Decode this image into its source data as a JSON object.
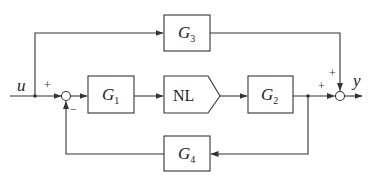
{
  "diagram": {
    "type": "block-diagram",
    "input": {
      "label": "u"
    },
    "output": {
      "label": "y"
    },
    "blocks": [
      {
        "id": "G1",
        "base": "G",
        "sub": "1"
      },
      {
        "id": "NL",
        "label": "NL"
      },
      {
        "id": "G2",
        "base": "G",
        "sub": "2"
      },
      {
        "id": "G3",
        "base": "G",
        "sub": "3"
      },
      {
        "id": "G4",
        "base": "G",
        "sub": "4"
      }
    ],
    "summing_junctions": [
      {
        "id": "sum-left",
        "signs": {
          "input_u": "+",
          "feedback_G4": "−"
        }
      },
      {
        "id": "sum-right",
        "signs": {
          "from_G3": "+",
          "from_G2": "+"
        }
      }
    ],
    "connections": [
      "u → sum-left (+)",
      "u → G3",
      "sum-left → G1",
      "G1 → NL",
      "NL → G2",
      "G2 → sum-right (+)",
      "G3 → sum-right (+)",
      "G2 output → G4",
      "G4 → sum-left (−)",
      "sum-right → y"
    ]
  }
}
